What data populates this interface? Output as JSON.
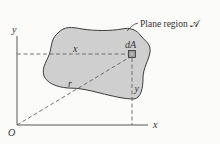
{
  "diagram": {
    "type": "plane-region-coordinate-figure",
    "colors": {
      "background": "#fbfbfa",
      "region_fill": "#cfcfcf",
      "region_stroke": "#3c3c3c",
      "axis": "#444444",
      "dash": "#555555",
      "element_fill": "#9a9a9a"
    },
    "axes": {
      "x_label": "x",
      "y_label": "y",
      "origin_label": "O"
    },
    "region_label": "Plane region 𝒜",
    "element_label": "dA",
    "distance_labels": {
      "horizontal": "x",
      "vertical": "y",
      "radial": "r"
    }
  }
}
